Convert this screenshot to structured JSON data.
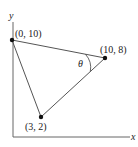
{
  "diagram": {
    "axes": {
      "x_label": "x",
      "y_label": "y"
    },
    "points": [
      {
        "id": "A",
        "label": "(0, 10)",
        "coords": [
          0,
          10
        ]
      },
      {
        "id": "B",
        "label": "(10, 8)",
        "coords": [
          10,
          8
        ]
      },
      {
        "id": "C",
        "label": "(3, 2)",
        "coords": [
          3,
          2
        ]
      }
    ],
    "angle": {
      "label": "θ",
      "vertex": "(10, 8)"
    },
    "colors": {
      "line": "#555555",
      "point": "#111111",
      "text": "#222222"
    }
  }
}
